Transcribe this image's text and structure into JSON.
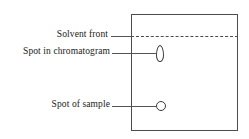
{
  "figure": {
    "background_color": "#ffffff",
    "line_color": "#4c4c4c",
    "text_color": "#1a1a1a"
  },
  "labels": {
    "solvent_front": "Solvent front",
    "spot_in_chromatogram": "Spot in chromatogram",
    "spot_of_sample": "Spot of sample"
  },
  "chart_data": {
    "type": "diagram",
    "title": "",
    "elements": [
      {
        "name": "plate",
        "shape": "rectangle",
        "x": 131,
        "y": 14,
        "width": 107,
        "height": 117,
        "stroke": "#4c4c4c",
        "fill": "#ffffff"
      },
      {
        "name": "solvent-front-line",
        "shape": "dashed-line",
        "x1": 131,
        "y1": 36,
        "x2": 238,
        "y2": 36,
        "stroke": "#4a4a4a",
        "label": "Solvent front"
      },
      {
        "name": "spot-in-chromatogram",
        "shape": "ellipse",
        "cx": 160,
        "cy": 54,
        "rx": 4,
        "ry": 8.5,
        "stroke": "#3a3a3a",
        "fill": "#ffffff",
        "label": "Spot in chromatogram"
      },
      {
        "name": "spot-of-sample",
        "shape": "circle",
        "cx": 161,
        "cy": 106,
        "r": 5,
        "stroke": "#3a3a3a",
        "fill": "#ffffff",
        "label": "Spot of sample"
      }
    ],
    "leader_lines": [
      {
        "target": "solvent-front-line",
        "x1": 111,
        "y1": 36,
        "x2": 132,
        "y2": 36
      },
      {
        "target": "spot-in-chromatogram",
        "x1": 112,
        "y1": 53,
        "x2": 156,
        "y2": 53
      },
      {
        "target": "spot-of-sample",
        "x1": 112,
        "y1": 106,
        "x2": 156,
        "y2": 106
      }
    ]
  }
}
